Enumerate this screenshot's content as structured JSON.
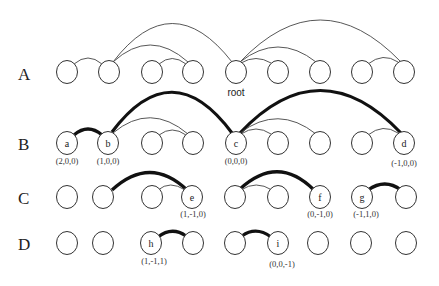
{
  "rows": [
    {
      "label": "A",
      "y": 72
    },
    {
      "label": "B",
      "y": 143
    },
    {
      "label": "C",
      "y": 197
    },
    {
      "label": "D",
      "y": 243
    }
  ],
  "root_label": "root",
  "nodes": {
    "a": {
      "letter": "a",
      "coord": "(2,0,0)"
    },
    "b": {
      "letter": "b",
      "coord": "(1,0,0)"
    },
    "c": {
      "letter": "c",
      "coord": "(0,0,0)"
    },
    "d": {
      "letter": "d",
      "coord": "(-1,0,0)"
    },
    "e": {
      "letter": "e",
      "coord": "(1,-1,0)"
    },
    "f": {
      "letter": "f",
      "coord": "(0,-1,0)"
    },
    "g": {
      "letter": "g",
      "coord": "(-1,1,0)"
    },
    "h": {
      "letter": "h",
      "coord": "(1,-1,1)"
    },
    "i": {
      "letter": "i",
      "coord": "(0,0,-1)"
    }
  },
  "colors": {
    "stroke": "#333333",
    "thick_edge": "#111111",
    "background": "#ffffff"
  }
}
